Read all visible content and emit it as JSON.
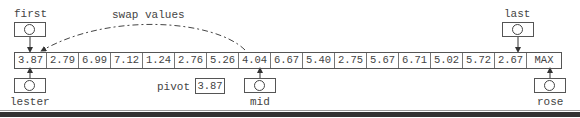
{
  "diagram": {
    "annotation": "swap values",
    "array": {
      "cells": [
        "3.87",
        "2.79",
        "6.99",
        "7.12",
        "1.24",
        "2.76",
        "5.26",
        "4.04",
        "6.67",
        "5.40",
        "2.75",
        "5.67",
        "6.71",
        "5.02",
        "5.72",
        "2.67",
        "MAX"
      ]
    },
    "pointers": {
      "first": {
        "label": "first",
        "index": 0,
        "position": "above"
      },
      "last": {
        "label": "last",
        "index": 15,
        "position": "above"
      },
      "lester": {
        "label": "lester",
        "index": 0,
        "position": "below"
      },
      "mid": {
        "label": "mid",
        "index": 7,
        "position": "below"
      },
      "rose": {
        "label": "rose",
        "index": 16,
        "position": "below"
      }
    },
    "pivot": {
      "label": "pivot",
      "value": "3.87"
    }
  }
}
